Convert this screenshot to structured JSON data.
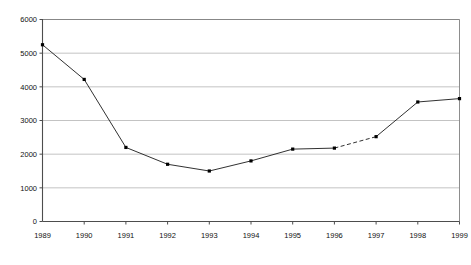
{
  "chart_data": {
    "type": "line",
    "title": "",
    "subtitle": "",
    "xlabel": "",
    "ylabel": "",
    "categories": [
      "1989",
      "1990",
      "1991",
      "1992",
      "1993",
      "1994",
      "1995",
      "1996",
      "1997",
      "1998",
      "1999"
    ],
    "x": [
      1989,
      1990,
      1991,
      1992,
      1993,
      1994,
      1995,
      1996,
      1997,
      1998,
      1999
    ],
    "values": [
      5250,
      4220,
      2200,
      1700,
      1500,
      1800,
      2150,
      2180,
      2520,
      3550,
      3650
    ],
    "series": [
      {
        "name": "series-1",
        "values": [
          5250,
          4220,
          2200,
          1700,
          1500,
          1800,
          2150,
          2180,
          2520,
          3550,
          3650
        ]
      }
    ],
    "ylim": [
      0,
      6000
    ],
    "xlim": [
      1989,
      1999
    ],
    "yticks": [
      0,
      1000,
      2000,
      3000,
      4000,
      5000,
      6000
    ],
    "ytick_labels": [
      "0",
      "1000",
      "2000",
      "3000",
      "4000",
      "5000",
      "6000"
    ],
    "xtick_labels": [
      "1989",
      "1990",
      "1991",
      "1992",
      "1993",
      "1994",
      "1995",
      "1996",
      "1997",
      "1998",
      "1999"
    ],
    "grid": {
      "horizontal": true,
      "vertical": false
    },
    "legend": {
      "visible": false,
      "position": "none"
    },
    "marker": "square",
    "dashed_segments": [
      {
        "from": "1996",
        "to": "1997"
      }
    ],
    "colors": {
      "line": "#1a1a1a",
      "marker": "#000000",
      "grid": "#b4b4b4",
      "axis": "#4d4d4d",
      "plot_border": "#808080",
      "background": "#ffffff",
      "tick_label": "#111111"
    }
  }
}
